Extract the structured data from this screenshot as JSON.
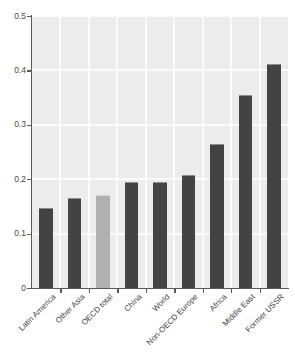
{
  "chart_data": {
    "type": "bar",
    "title": "",
    "subtitle": "",
    "xlabel": "",
    "ylabel": "",
    "categories": [
      "Latin America",
      "Other Asia",
      "OECD total",
      "China",
      "World",
      "Non-OECD Europe",
      "Africa",
      "Middle East",
      "Former USSR"
    ],
    "values": [
      0.148,
      0.166,
      0.171,
      0.194,
      0.195,
      0.207,
      0.265,
      0.355,
      0.412
    ],
    "series": [
      {
        "name": "value",
        "values": [
          0.148,
          0.166,
          0.171,
          0.194,
          0.195,
          0.207,
          0.265,
          0.355,
          0.412
        ]
      }
    ],
    "ylim": [
      0,
      0.5
    ],
    "ytick_labels": [
      "0",
      "0.1",
      "0.2",
      "0.3",
      "0.4",
      "0.5"
    ],
    "ytick_values": [
      0,
      0.1,
      0.2,
      0.3,
      0.4,
      0.5
    ],
    "xtick_labels": [
      "Latin America",
      "Other Asia",
      "OECD total",
      "China",
      "World",
      "Non-OECD Europe",
      "Africa",
      "Middle East",
      "Former USSR"
    ],
    "grid": true,
    "grid_orientation": "both",
    "legend": null,
    "legend_position": "none",
    "annotations": [],
    "highlighted_category": "OECD total",
    "bar_colors": [
      "#434343",
      "#434343",
      "#b0b0b0",
      "#434343",
      "#434343",
      "#434343",
      "#434343",
      "#434343",
      "#434343"
    ]
  },
  "style": {
    "panel_background": "#ececec",
    "gridline_color": "#fbfbfb",
    "axis_color": "#5a5a5a",
    "bar_color": "#434343",
    "highlight_bar_color": "#b0b0b0",
    "page_background": "#ffffff",
    "tick_label_color": "#4a4a4a",
    "xlabel_rotation": "-45"
  }
}
